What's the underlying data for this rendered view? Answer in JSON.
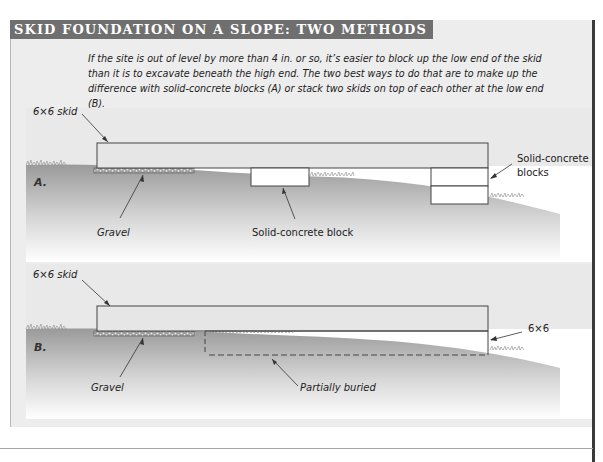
{
  "title": "SKID FOUNDATION ON A SLOPE: TWO METHODS",
  "intro_text": "If the site is out of level by more than 4 in. or so, it’s easier to block up the low end of the skid than it is to excavate beneath the high end. The two best ways to do that are to make up the difference with solid-concrete blocks (A) or stack two skids on top of each other at the low end (B).",
  "diagram_a": {
    "tag": "A.",
    "labels": {
      "skid": "6×6 skid",
      "gravel": "Gravel",
      "block": "Solid-concrete block",
      "blocks_line1": "Solid-concrete",
      "blocks_line2": "blocks"
    }
  },
  "diagram_b": {
    "tag": "B.",
    "labels": {
      "skid": "6×6 skid",
      "gravel": "Gravel",
      "lower_skid": "6×6",
      "buried": "Partially buried"
    }
  },
  "colors": {
    "title_bar": "#6f6f6f",
    "frame_bg": "#ededed",
    "skid_fill": "#e6e6e6",
    "ground_dark": "#9a9a9a",
    "outline": "#444444"
  }
}
